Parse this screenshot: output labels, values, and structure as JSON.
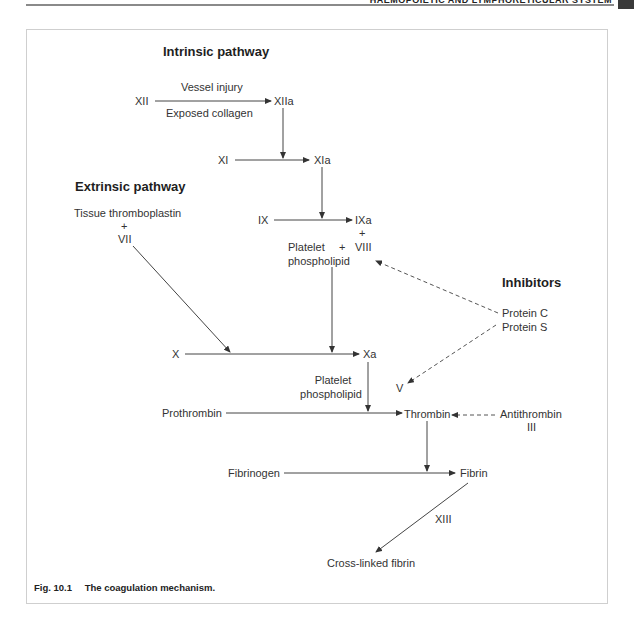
{
  "page_header": {
    "running_title": "HAEMOPOIETIC AND LYMPHORETICULAR SYSTEM"
  },
  "figure": {
    "number": "Fig. 10.1",
    "caption": "The coagulation mechanism."
  },
  "sections": {
    "intrinsic": "Intrinsic pathway",
    "extrinsic": "Extrinsic pathway",
    "inhibitors": "Inhibitors"
  },
  "nodes": {
    "xii": "XII",
    "xiia": "XIIa",
    "vessel_injury": "Vessel injury",
    "exposed_collagen": "Exposed collagen",
    "xi": "XI",
    "xia": "XIa",
    "ix": "IX",
    "ixa": "IXa",
    "plus_viii": "+",
    "viii": "VIII",
    "platelet_1": "Platelet",
    "plus_platelet": "+",
    "phospholipid_1": "phospholipid",
    "tissue_thromboplastin": "Tissue thromboplastin",
    "plus_vii": "+",
    "vii": "VII",
    "x": "X",
    "xa": "Xa",
    "platelet_2": "Platelet",
    "phospholipid_2": "phospholipid",
    "v": "V",
    "protein_c": "Protein C",
    "protein_s": "Protein S",
    "prothrombin": "Prothrombin",
    "thrombin": "Thrombin",
    "antithrombin": "Antithrombin",
    "antithrombin_iii": "III",
    "fibrinogen": "Fibrinogen",
    "fibrin": "Fibrin",
    "xiii": "XIII",
    "cross_linked_fibrin": "Cross-linked fibrin"
  },
  "colors": {
    "line": "#444444",
    "text": "#333333",
    "frame": "#cfcfcf"
  }
}
